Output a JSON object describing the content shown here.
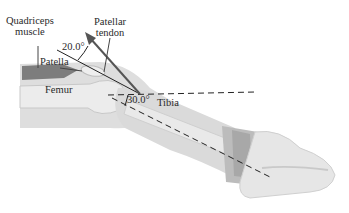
{
  "figure": {
    "labels": {
      "quadriceps": [
        "Quadriceps",
        "muscle"
      ],
      "patellar_tendon": [
        "Patellar",
        "tendon"
      ],
      "patella": "Patella",
      "femur": "Femur",
      "tibia": "Tibia",
      "angle_tendon": "20.0°",
      "angle_leg": "30.0°"
    },
    "colors": {
      "leg_fill": "#dcdcdc",
      "leg_shade": "#c4c4c4",
      "muscle": "#7a7a7a",
      "bone": "#ececec",
      "arrow": "#555555",
      "line": "#222222",
      "strap": "#b8b8b8",
      "shoe": "#e6e6e6"
    }
  }
}
